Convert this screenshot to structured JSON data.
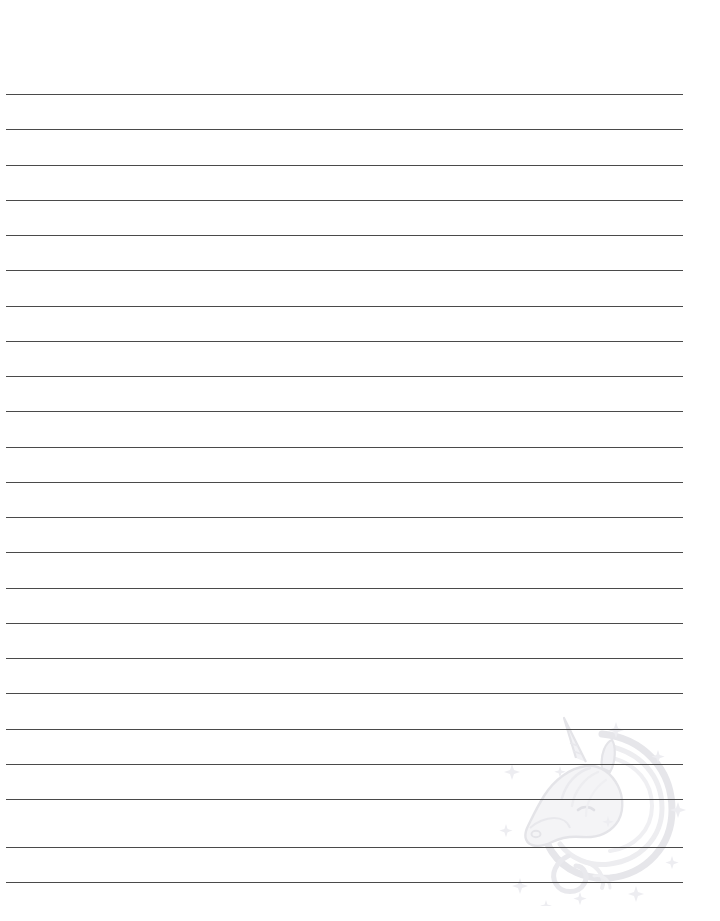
{
  "page": {
    "width": 720,
    "height": 921,
    "background_color": "#ffffff"
  },
  "ruled_lines": {
    "name": "ruled-writing-lines",
    "count": 23,
    "color": "#4a4a4a",
    "thickness_px": 1,
    "x_start": 6,
    "x_end": 683,
    "first_line_y": 94,
    "spacing_px": 35.2,
    "y_positions": [
      94,
      129,
      165,
      200,
      235,
      270,
      306,
      341,
      376,
      411,
      447,
      482,
      517,
      552,
      588,
      623,
      658,
      693,
      729,
      764,
      799,
      847,
      882
    ]
  },
  "watermark": {
    "name": "unicorn-watermark",
    "subject": "unicorn-head",
    "description": "Faint decorative unicorn head with flowing mane, spiral horn and small stars",
    "color": "#ececee",
    "accent_color": "#e4e4e8",
    "star_color": "#eeeef1",
    "opacity": 1,
    "x": 490,
    "y": 706,
    "width": 200,
    "height": 200,
    "elements": [
      "horn",
      "ear",
      "eye",
      "muzzle",
      "mane-swirl",
      "neck",
      "tail-curl",
      "stars"
    ]
  }
}
